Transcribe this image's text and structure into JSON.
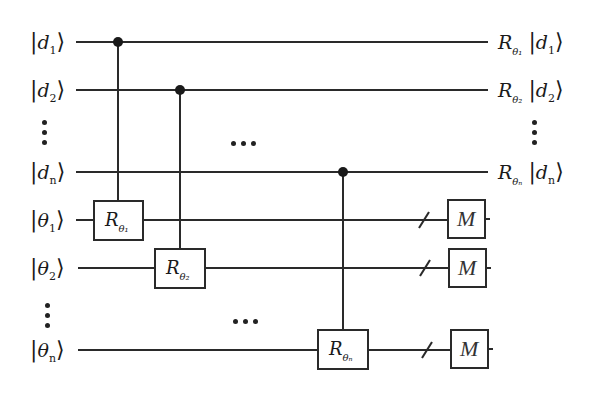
{
  "diagram": {
    "type": "quantum-circuit",
    "inputs": [
      {
        "id": "d1",
        "symbol": "d",
        "index": "1",
        "y": 42
      },
      {
        "id": "d2",
        "symbol": "d",
        "index": "2",
        "y": 90
      },
      {
        "id": "dn",
        "symbol": "d",
        "index": "n",
        "y": 172
      },
      {
        "id": "theta1",
        "symbol": "θ",
        "index": "1",
        "y": 220
      },
      {
        "id": "theta2",
        "symbol": "θ",
        "index": "2",
        "y": 268
      },
      {
        "id": "thetan",
        "symbol": "θ",
        "index": "n",
        "y": 350
      }
    ],
    "input_labels": {
      "d1": "|d₁⟩",
      "d2": "|d₂⟩",
      "dn": "|dₙ⟩",
      "theta1": "|θ₁⟩",
      "theta2": "|θ₂⟩",
      "thetan": "|θₙ⟩"
    },
    "outputs": {
      "d1": {
        "op": "R",
        "op_sub": "θ₁",
        "state": "d",
        "state_sub": "1"
      },
      "d2": {
        "op": "R",
        "op_sub": "θ₂",
        "state": "d",
        "state_sub": "2"
      },
      "dn": {
        "op": "R",
        "op_sub": "θₙ",
        "state": "d",
        "state_sub": "n"
      }
    },
    "gates": [
      {
        "name": "R",
        "subscript": "θ₁",
        "target": "theta1",
        "control": "d1"
      },
      {
        "name": "R",
        "subscript": "θ₂",
        "target": "theta2",
        "control": "d2"
      },
      {
        "name": "R",
        "subscript": "θₙ",
        "target": "thetan",
        "control": "dn"
      }
    ],
    "measurements": [
      {
        "label": "M",
        "wire": "theta1"
      },
      {
        "label": "M",
        "wire": "theta2"
      },
      {
        "label": "M",
        "wire": "thetan"
      }
    ],
    "ellipsis": "⋯",
    "vertical_ellipsis": "⋮",
    "colors": {
      "line": "#2a2a2a",
      "background": "#ffffff",
      "text": "#1a1a1a"
    }
  }
}
